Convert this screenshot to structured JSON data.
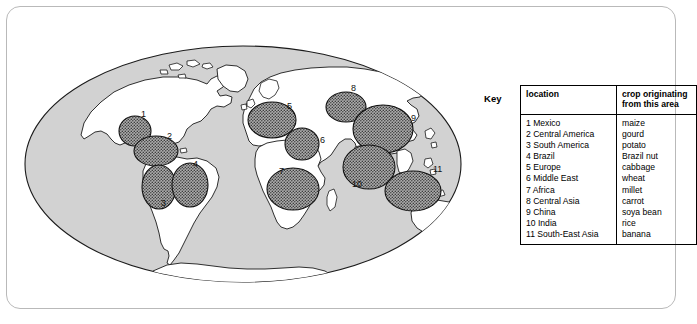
{
  "figure": {
    "map_title": "world-map-crop-origins"
  },
  "key": {
    "label": "Key",
    "headers": {
      "location": "location",
      "crop": "crop originating from this area",
      "crop_line1": "crop originating",
      "crop_line2": "from this area"
    },
    "rows": [
      {
        "num": "1",
        "location": "1 Mexico",
        "crop": "maize"
      },
      {
        "num": "2",
        "location": "2 Central America",
        "crop": "gourd"
      },
      {
        "num": "3",
        "location": "3 South America",
        "crop": "potato"
      },
      {
        "num": "4",
        "location": "4 Brazil",
        "crop": "Brazil nut"
      },
      {
        "num": "5",
        "location": "5 Europe",
        "crop": "cabbage"
      },
      {
        "num": "6",
        "location": "6 Middle East",
        "crop": "wheat"
      },
      {
        "num": "7",
        "location": "7 Africa",
        "crop": "millet"
      },
      {
        "num": "8",
        "location": "8 Central Asia",
        "crop": "carrot"
      },
      {
        "num": "9",
        "location": "9 China",
        "crop": "soya bean"
      },
      {
        "num": "10",
        "location": "10 India",
        "crop": "rice"
      },
      {
        "num": "11",
        "location": "11 South-East Asia",
        "crop": "banana"
      }
    ]
  },
  "map": {
    "ocean_color": "#d2d2d2",
    "land_color": "#ffffff",
    "region_fill": "#9a9a9a",
    "outline_color": "#1a1a1a",
    "regions": [
      {
        "num": "1",
        "name": "Mexico",
        "label_x": 120,
        "label_y": 78,
        "cx": 114,
        "cy": 92,
        "rx": 16,
        "ry": 15
      },
      {
        "num": "2",
        "name": "Central America",
        "label_x": 146,
        "label_y": 100,
        "cx": 135,
        "cy": 112,
        "rx": 22,
        "ry": 15
      },
      {
        "num": "3",
        "name": "South America",
        "label_x": 140,
        "label_y": 167,
        "cx": 138,
        "cy": 148,
        "rx": 17,
        "ry": 22
      },
      {
        "num": "4",
        "name": "Brazil",
        "label_x": 172,
        "label_y": 128,
        "cx": 169,
        "cy": 146,
        "rx": 18,
        "ry": 22
      },
      {
        "num": "5",
        "name": "Europe",
        "label_x": 266,
        "label_y": 70,
        "cx": 251,
        "cy": 81,
        "rx": 24,
        "ry": 18
      },
      {
        "num": "6",
        "name": "Middle East",
        "label_x": 299,
        "label_y": 104,
        "cx": 281,
        "cy": 105,
        "rx": 17,
        "ry": 16
      },
      {
        "num": "7",
        "name": "Africa",
        "label_x": 258,
        "label_y": 135,
        "cx": 272,
        "cy": 150,
        "rx": 26,
        "ry": 21
      },
      {
        "num": "8",
        "name": "Central Asia",
        "label_x": 330,
        "label_y": 52,
        "cx": 325,
        "cy": 68,
        "rx": 20,
        "ry": 15
      },
      {
        "num": "9",
        "name": "China",
        "label_x": 390,
        "label_y": 82,
        "cx": 362,
        "cy": 90,
        "rx": 30,
        "ry": 24
      },
      {
        "num": "10",
        "name": "India",
        "label_x": 331,
        "label_y": 148,
        "cx": 348,
        "cy": 128,
        "rx": 26,
        "ry": 22
      },
      {
        "num": "11",
        "name": "South-East Asia",
        "label_x": 412,
        "label_y": 133,
        "cx": 392,
        "cy": 152,
        "rx": 28,
        "ry": 20
      }
    ]
  }
}
